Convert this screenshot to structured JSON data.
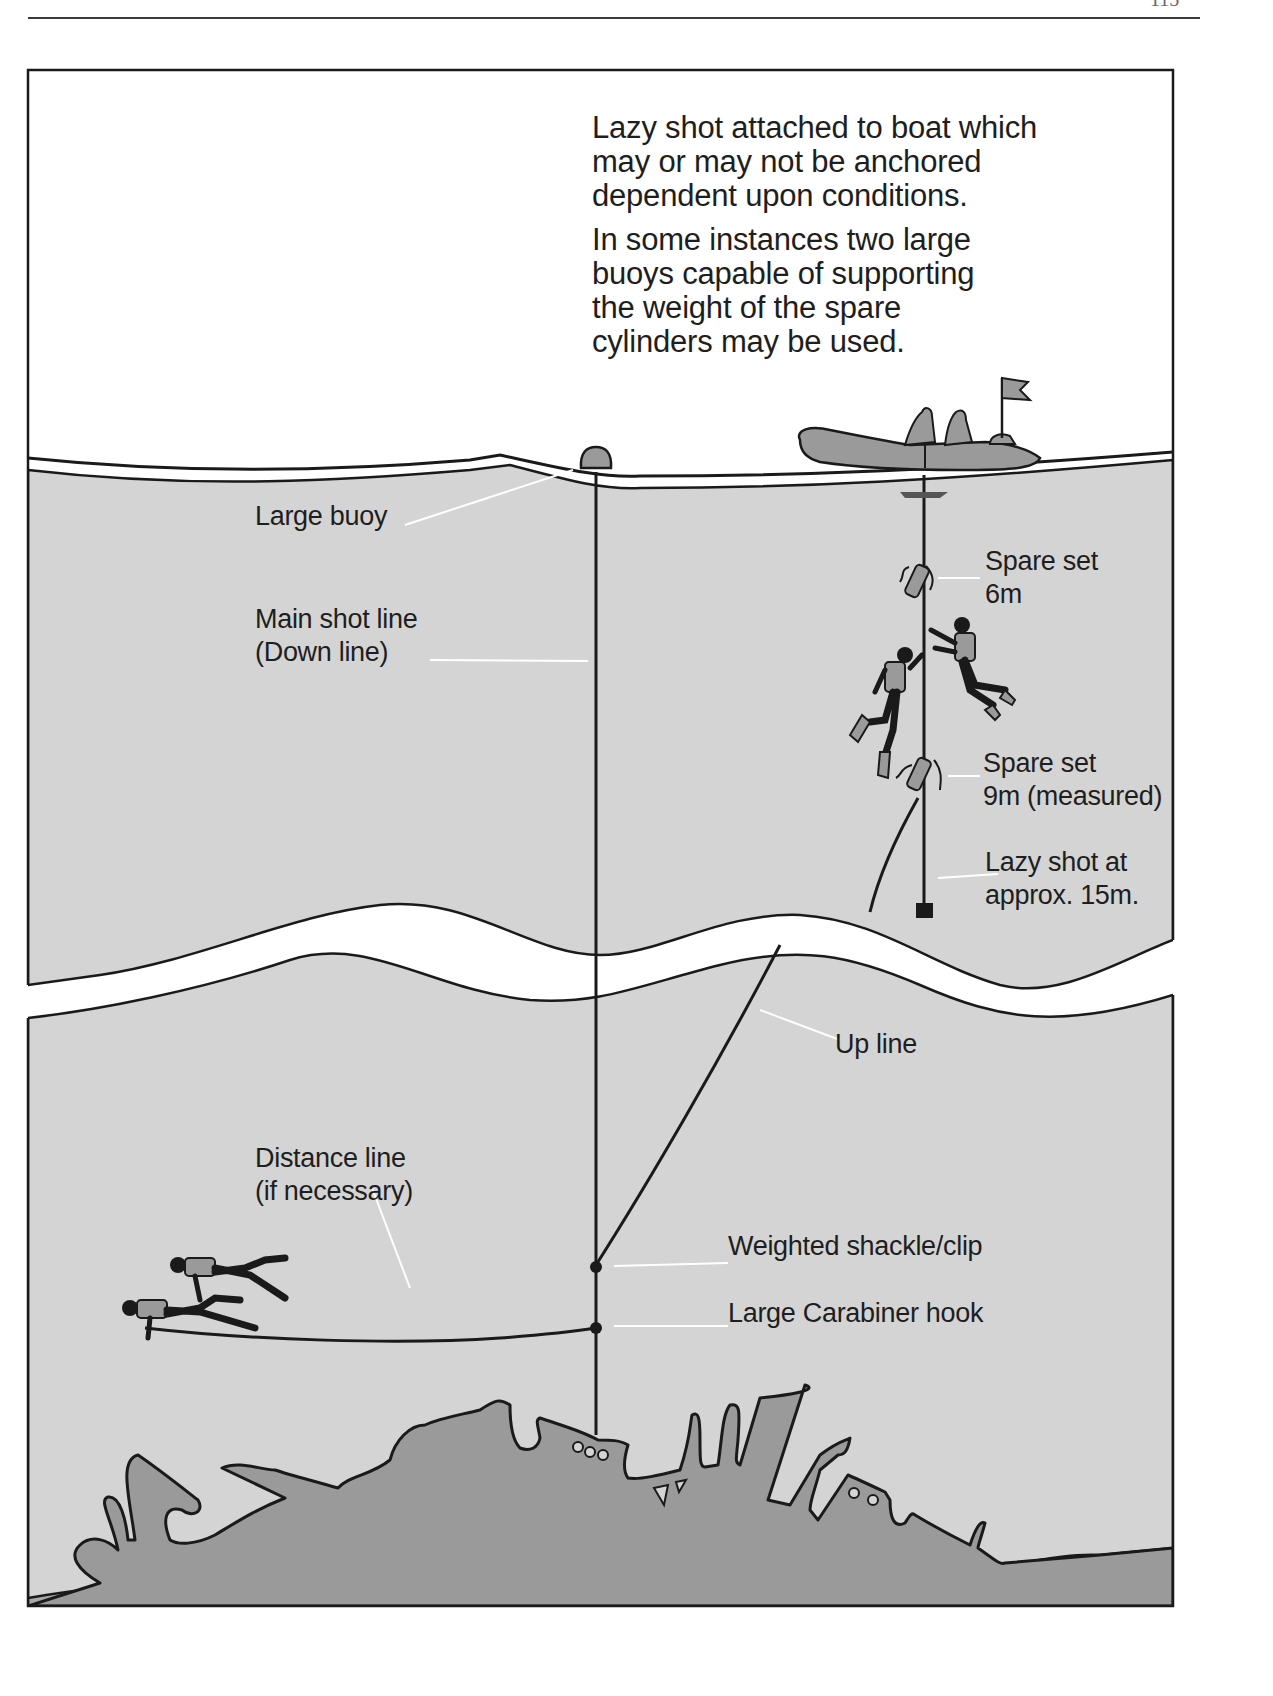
{
  "page": {
    "number": "115",
    "colors": {
      "water": "#d4d4d4",
      "wreck": "#9a9a9a",
      "seabed": "#a8a8a8",
      "outline": "#1a1a1a",
      "label_text": "#1e1e1e",
      "pointer": "#ffffff"
    }
  },
  "diagram": {
    "caption": {
      "paragraph1": [
        "Lazy shot attached to boat which",
        "may or may not be anchored",
        "dependent upon conditions."
      ],
      "paragraph2": [
        "In some instances two large",
        "buoys capable of supporting",
        "the weight of the spare",
        "cylinders may be used."
      ]
    },
    "labels": {
      "large_buoy": "Large buoy",
      "main_shot_line": [
        "Main shot line",
        "(Down line)"
      ],
      "spare_set_6m": [
        "Spare set",
        "6m"
      ],
      "spare_set_9m": [
        "Spare set",
        "9m (measured)"
      ],
      "lazy_shot": [
        "Lazy shot at",
        "approx. 15m."
      ],
      "up_line": "Up line",
      "distance_line": [
        "Distance line",
        "(if necessary)"
      ],
      "weighted_shackle": "Weighted  shackle/clip",
      "carabiner": "Large Carabiner hook"
    },
    "elements": [
      "boat",
      "flag",
      "large-buoy",
      "main-shot-line",
      "lazy-shot-line",
      "spare-cylinder-6m",
      "spare-cylinder-9m",
      "lazy-shot-weight",
      "up-line",
      "distance-line",
      "divers",
      "wreck",
      "seabed",
      "depth-break"
    ]
  }
}
